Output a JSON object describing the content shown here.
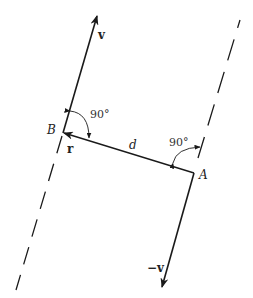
{
  "diagram": {
    "type": "vector-geometry",
    "colors": {
      "line": "#1a1a1a",
      "background": "#ffffff"
    },
    "points": {
      "A": {
        "label": "A"
      },
      "B": {
        "label": "B"
      }
    },
    "vectors": {
      "v": {
        "label": "v"
      },
      "neg_v": {
        "label": "−v"
      },
      "r": {
        "label": "r"
      }
    },
    "distance": {
      "label": "d"
    },
    "angles": {
      "at_B": {
        "label": "90°"
      },
      "at_A": {
        "label": "90°"
      }
    }
  }
}
